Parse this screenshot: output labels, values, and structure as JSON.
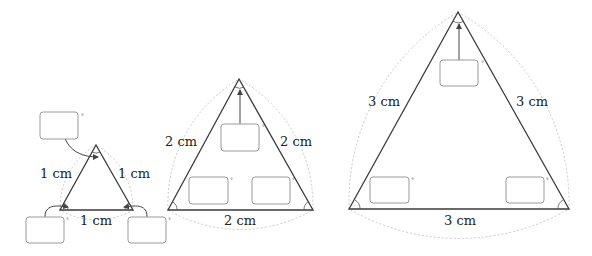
{
  "degree_symbol": "°",
  "triangles": [
    {
      "name": "small",
      "side_length": "1 cm",
      "labels": {
        "left": "1 cm",
        "right": "1 cm",
        "bottom": "1 cm"
      },
      "angle_inputs": [
        "",
        "",
        ""
      ]
    },
    {
      "name": "medium",
      "side_length": "2 cm",
      "labels": {
        "left": "2 cm",
        "right": "2 cm",
        "bottom": "2 cm"
      },
      "angle_inputs": [
        "",
        "",
        ""
      ]
    },
    {
      "name": "large",
      "side_length": "3 cm",
      "labels": {
        "left": "3 cm",
        "right": "3 cm",
        "bottom": "3 cm"
      },
      "angle_inputs": [
        "",
        "",
        ""
      ]
    }
  ]
}
